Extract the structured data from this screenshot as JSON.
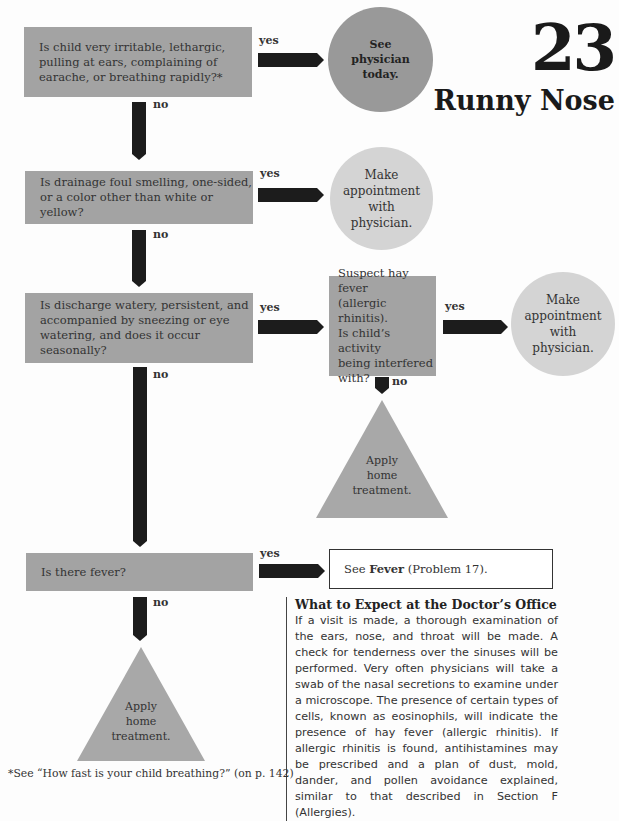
{
  "title": {
    "number": "23",
    "text": "Runny Nose"
  },
  "flowchart": {
    "questions": [
      {
        "id": "q1",
        "text": "Is child very irritable, lethargic, pulling at ears, complaining of earache, or breathing rapidly?*",
        "lines": [
          "Is child very irritable, lethargic,",
          "pulling at ears, complaining of",
          "earache, or breathing rapidly?*"
        ]
      },
      {
        "id": "q2",
        "text": "Is drainage foul smelling, one-sided, or a color other than white or yellow?",
        "lines": [
          "Is drainage foul smelling, one-sided,",
          "or a color other than white or yellow?"
        ]
      },
      {
        "id": "q3",
        "text": "Is discharge watery, persistent, and accompanied by sneezing or eye watering, and does it occur seasonally?",
        "lines": [
          "Is discharge watery, persistent, and",
          "accompanied by sneezing or eye",
          "watering, and does it occur seasonally?"
        ]
      },
      {
        "id": "q3b",
        "text": "Suspect hay fever (allergic rhinitis). Is child's activity being interfered with?",
        "lines": [
          "Suspect hay fever",
          "(allergic rhinitis).",
          "Is child’s activity",
          "being interfered",
          "with?"
        ]
      },
      {
        "id": "q4",
        "text": "Is there fever?",
        "lines": [
          "Is there fever?"
        ]
      }
    ],
    "outcomes": [
      {
        "id": "o1",
        "shape": "circle-dark",
        "lines": [
          "See",
          "physician",
          "today."
        ]
      },
      {
        "id": "o2",
        "shape": "circle-light",
        "lines": [
          "Make",
          "appointment",
          "with",
          "physician."
        ]
      },
      {
        "id": "o3",
        "shape": "circle-light",
        "lines": [
          "Make",
          "appointment",
          "with",
          "physician."
        ]
      },
      {
        "id": "o4",
        "shape": "triangle",
        "lines": [
          "Apply",
          "home",
          "treatment."
        ]
      },
      {
        "id": "o5",
        "shape": "box",
        "prefix": "See ",
        "bold": "Fever",
        "suffix": " (Problem 17)."
      },
      {
        "id": "o6",
        "shape": "triangle",
        "lines": [
          "Apply",
          "home",
          "treatment."
        ]
      }
    ],
    "labels": {
      "yes": "yes",
      "no": "no"
    },
    "colors": {
      "question_box": "#a3a3a3",
      "arrow": "#1c1c1c",
      "circle_dark": "#999999",
      "circle_light": "#d4d4d4",
      "triangle": "#a8a8a8"
    }
  },
  "article": {
    "heading": "What to Expect at the Doctor’s Office",
    "body": "If a visit is made, a thorough examination of the ears, nose, and throat will be made. A check for tenderness over the sinuses will be performed. Very often physicians will take a swab of the nasal secretions to examine under a micro­scope. The presence of certain types of cells, known as eosinophils, will indicate the pres­ence of hay fever (allergic rhinitis). If allergic rhinitis is found, antihistamines may be pre­scribed and a plan of dust, mold, dander, and pollen avoidance explained, similar to that de­scribed in Section F (Allergies)."
  },
  "footnote": "*See “How fast is your child breathing?” (on p. 142)"
}
